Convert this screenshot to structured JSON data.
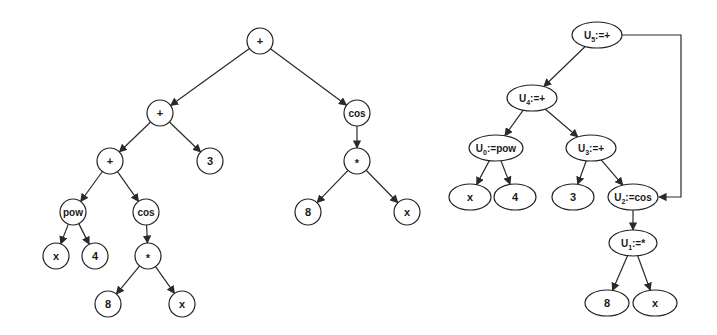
{
  "diagram": {
    "expression_tree": {
      "description": "Expression tree",
      "nodes": [
        {
          "id": "t_root",
          "label": "+"
        },
        {
          "id": "t_plus2",
          "label": "+"
        },
        {
          "id": "t_cos1",
          "label": "cos"
        },
        {
          "id": "t_plus3",
          "label": "+"
        },
        {
          "id": "t_three",
          "label": "3"
        },
        {
          "id": "t_mul1",
          "label": "*"
        },
        {
          "id": "t_pow",
          "label": "pow"
        },
        {
          "id": "t_cos2",
          "label": "cos"
        },
        {
          "id": "t_eight1",
          "label": "8"
        },
        {
          "id": "t_x1",
          "label": "x"
        },
        {
          "id": "t_x2",
          "label": "x"
        },
        {
          "id": "t_four",
          "label": "4"
        },
        {
          "id": "t_mul2",
          "label": "*"
        },
        {
          "id": "t_eight2",
          "label": "8"
        },
        {
          "id": "t_x3",
          "label": "x"
        }
      ],
      "edges": [
        [
          "t_root",
          "t_plus2"
        ],
        [
          "t_root",
          "t_cos1"
        ],
        [
          "t_plus2",
          "t_plus3"
        ],
        [
          "t_plus2",
          "t_three"
        ],
        [
          "t_cos1",
          "t_mul1"
        ],
        [
          "t_mul1",
          "t_eight1"
        ],
        [
          "t_mul1",
          "t_x1"
        ],
        [
          "t_plus3",
          "t_pow"
        ],
        [
          "t_plus3",
          "t_cos2"
        ],
        [
          "t_pow",
          "t_x2"
        ],
        [
          "t_pow",
          "t_four"
        ],
        [
          "t_cos2",
          "t_mul2"
        ],
        [
          "t_mul2",
          "t_eight2"
        ],
        [
          "t_mul2",
          "t_x3"
        ]
      ]
    },
    "dag": {
      "description": "Directed acyclic graph with shared subexpression",
      "nodes": [
        {
          "id": "d_u5",
          "var": "U",
          "sub": "5",
          "op": ":=+"
        },
        {
          "id": "d_u4",
          "var": "U",
          "sub": "4",
          "op": ":=+"
        },
        {
          "id": "d_u0",
          "var": "U",
          "sub": "0",
          "op": ":=pow"
        },
        {
          "id": "d_u3",
          "var": "U",
          "sub": "3",
          "op": ":=+"
        },
        {
          "id": "d_x1",
          "label": "x"
        },
        {
          "id": "d_four",
          "label": "4"
        },
        {
          "id": "d_three",
          "label": "3"
        },
        {
          "id": "d_u2",
          "var": "U",
          "sub": "2",
          "op": ":=cos"
        },
        {
          "id": "d_u1",
          "var": "U",
          "sub": "1",
          "op": ":=*"
        },
        {
          "id": "d_eight",
          "label": "8"
        },
        {
          "id": "d_x2",
          "label": "x"
        }
      ],
      "edges": [
        [
          "d_u5",
          "d_u4"
        ],
        [
          "d_u4",
          "d_u0"
        ],
        [
          "d_u4",
          "d_u3"
        ],
        [
          "d_u0",
          "d_x1"
        ],
        [
          "d_u0",
          "d_four"
        ],
        [
          "d_u3",
          "d_three"
        ],
        [
          "d_u3",
          "d_u2"
        ],
        [
          "d_u2",
          "d_u1"
        ],
        [
          "d_u1",
          "d_eight"
        ],
        [
          "d_u1",
          "d_x2"
        ]
      ],
      "shared_edge": [
        "d_u5",
        "d_u2"
      ]
    }
  }
}
